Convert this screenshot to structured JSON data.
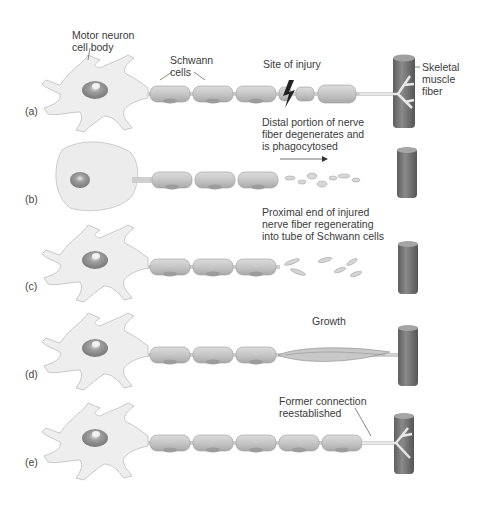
{
  "figure": {
    "panels": [
      {
        "id": "a",
        "label": "(a)"
      },
      {
        "id": "b",
        "label": "(b)"
      },
      {
        "id": "c",
        "label": "(c)"
      },
      {
        "id": "d",
        "label": "(d)"
      },
      {
        "id": "e",
        "label": "(e)"
      }
    ],
    "annotations": {
      "motor_neuron": "Motor neuron\ncell body",
      "schwann": "Schwann\ncells",
      "injury": "Site of injury",
      "muscle": "Skeletal\nmuscle\nfiber",
      "distal": "Distal portion of nerve\nfiber degenerates and\nis phagocytosed",
      "proximal": "Proximal end of injured\nnerve fiber regenerating\ninto tube of Schwann cells",
      "growth": "Growth",
      "former": "Former connection\nreestablished"
    },
    "colors": {
      "cell": "#ececec",
      "cell_stroke": "#b8b8b8",
      "schwann": "#c9c9c9",
      "schwann_stroke": "#9a9a9a",
      "nucleus": "#8f8f8f",
      "muscle": "#6e6e6e",
      "muscle_light": "#a5a5a5"
    }
  }
}
